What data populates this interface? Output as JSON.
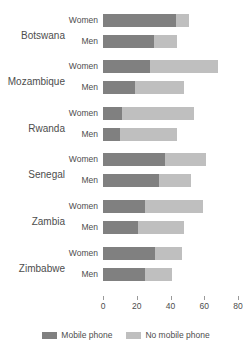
{
  "chart_data": {
    "type": "bar",
    "orientation": "horizontal",
    "stacked": true,
    "title": "",
    "xlabel": "",
    "ylabel": "",
    "xlim": [
      0,
      80
    ],
    "xticks": [
      0,
      20,
      40,
      60,
      80
    ],
    "xtick_labels": [
      "0",
      "20",
      "40",
      "60",
      "80"
    ],
    "grid": false,
    "legend_position": "bottom",
    "series": [
      {
        "name": "Mobile phone",
        "color": "#808080"
      },
      {
        "name": "No mobile phone",
        "color": "#bfbfbf"
      }
    ],
    "groups": [
      {
        "country": "Botswana",
        "rows": [
          {
            "label": "Women",
            "mobile": 43,
            "no_mobile": 8,
            "total": 51
          },
          {
            "label": "Men",
            "mobile": 30,
            "no_mobile": 14,
            "total": 44
          }
        ]
      },
      {
        "country": "Mozambique",
        "rows": [
          {
            "label": "Women",
            "mobile": 28,
            "no_mobile": 40,
            "total": 68
          },
          {
            "label": "Men",
            "mobile": 19,
            "no_mobile": 29,
            "total": 48
          }
        ]
      },
      {
        "country": "Rwanda",
        "rows": [
          {
            "label": "Women",
            "mobile": 11,
            "no_mobile": 43,
            "total": 54
          },
          {
            "label": "Men",
            "mobile": 10,
            "no_mobile": 34,
            "total": 44
          }
        ]
      },
      {
        "country": "Senegal",
        "rows": [
          {
            "label": "Women",
            "mobile": 37,
            "no_mobile": 24,
            "total": 61
          },
          {
            "label": "Men",
            "mobile": 33,
            "no_mobile": 19,
            "total": 52
          }
        ]
      },
      {
        "country": "Zambia",
        "rows": [
          {
            "label": "Women",
            "mobile": 25,
            "no_mobile": 34,
            "total": 59
          },
          {
            "label": "Men",
            "mobile": 21,
            "no_mobile": 27,
            "total": 48
          }
        ]
      },
      {
        "country": "Zimbabwe",
        "rows": [
          {
            "label": "Women",
            "mobile": 31,
            "no_mobile": 16,
            "total": 47
          },
          {
            "label": "Men",
            "mobile": 25,
            "no_mobile": 16,
            "total": 41
          }
        ]
      }
    ]
  },
  "legend": {
    "items": [
      {
        "label": "Mobile phone",
        "color": "#808080"
      },
      {
        "label": "No mobile phone",
        "color": "#bfbfbf"
      }
    ]
  },
  "colors": {
    "mobile": "#808080",
    "no_mobile": "#bfbfbf",
    "text": "#4d4d4d",
    "background": "#ffffff"
  }
}
